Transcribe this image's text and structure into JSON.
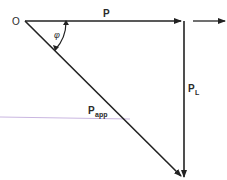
{
  "diagram": {
    "colors": {
      "line": "#222222",
      "text": "#2a2a2a",
      "stray_line": "#c9b6e0",
      "background": "#ffffff"
    },
    "labels": {
      "origin": "O",
      "real_power": "P",
      "reactive_power_main": "P",
      "reactive_power_sub": "L",
      "apparent_power_main": "P",
      "apparent_power_sub": "app",
      "angle": "φ"
    },
    "vectors": [
      {
        "name": "P",
        "from": [
          25,
          21
        ],
        "to": [
          182,
          21
        ]
      },
      {
        "name": "P_L",
        "from": [
          183,
          21
        ],
        "to": [
          183,
          178
        ]
      },
      {
        "name": "P_app",
        "from": [
          25,
          21
        ],
        "to": [
          181,
          176
        ]
      },
      {
        "name": "direction-arrow",
        "from": [
          193,
          21
        ],
        "to": [
          226,
          21
        ]
      }
    ]
  }
}
